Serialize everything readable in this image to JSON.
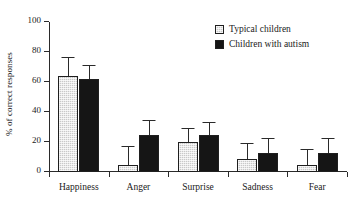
{
  "chart_data": {
    "type": "bar",
    "title": "",
    "subtitle": "",
    "xlabel": "",
    "ylabel": "% of correct responses",
    "ylim": [
      0,
      100
    ],
    "yticks": [
      0,
      20,
      40,
      60,
      80,
      100
    ],
    "ytick_labels": [
      "0",
      "20",
      "40",
      "60",
      "80",
      "100"
    ],
    "grid": false,
    "legend_position": "top-right",
    "categories": [
      "Happiness",
      "Anger",
      "Surprise",
      "Sadness",
      "Fear"
    ],
    "series": [
      {
        "name": "Typical children",
        "color": "#c9c9c9",
        "pattern": "dotted-fill",
        "values": [
          64,
          5,
          20,
          9,
          5
        ],
        "errors": [
          12,
          12,
          9,
          10,
          10
        ]
      },
      {
        "name": "Children with autism",
        "color": "#151515",
        "pattern": "solid-fill",
        "values": [
          62,
          25,
          25,
          13,
          13
        ],
        "errors": [
          9,
          9,
          8,
          9,
          9
        ]
      }
    ]
  },
  "legend": {
    "entries": [
      {
        "label": "Typical children"
      },
      {
        "label": "Children with autism"
      }
    ]
  },
  "colors": {
    "typical": "#c9c9c9",
    "autism": "#151515",
    "axis": "#2a2a2a",
    "background": "#ffffff"
  }
}
